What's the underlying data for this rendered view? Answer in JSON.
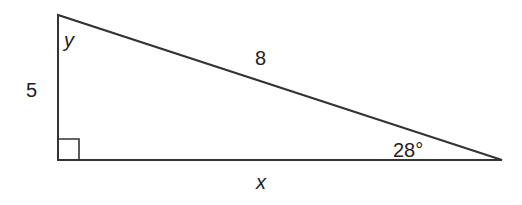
{
  "diagram": {
    "type": "right-triangle",
    "stroke_color": "#333333",
    "vertices": {
      "top": [
        58,
        15
      ],
      "right_angle": [
        58,
        160
      ],
      "right": [
        502,
        160
      ]
    },
    "right_angle_marker_size": 21,
    "labels": {
      "angle_top": "y",
      "vertical_leg": "5",
      "hypotenuse": "8",
      "angle_right": "28°",
      "horizontal_leg": "x"
    }
  }
}
